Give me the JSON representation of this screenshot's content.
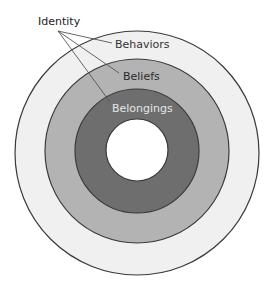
{
  "diagram": {
    "type": "concentric-circles",
    "title_label": "Identity",
    "rings": [
      {
        "name": "behaviors",
        "label": "Behaviors",
        "fill": "#f0f0f0",
        "text_color": "#333333"
      },
      {
        "name": "beliefs",
        "label": "Beliefs",
        "fill": "#b3b3b3",
        "text_color": "#2b2b2b"
      },
      {
        "name": "belongings",
        "label": "Belongings",
        "fill": "#6e6e6e",
        "text_color": "#e6e6e6"
      }
    ],
    "center_fill": "#ffffff",
    "stroke_color": "#3a3a3a",
    "leader_color": "#555555"
  }
}
